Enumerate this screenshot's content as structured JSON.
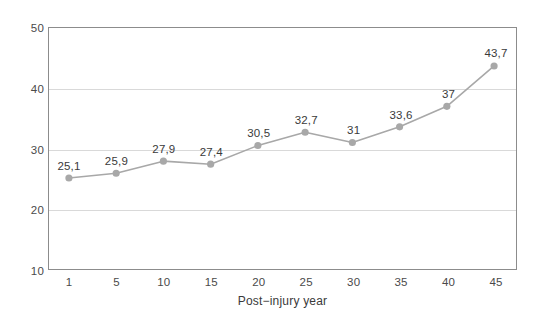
{
  "chart_data": {
    "type": "line",
    "title": "",
    "subtitle": "",
    "xlabel": "Post−injury year",
    "ylabel": "",
    "categories": [
      "1",
      "5",
      "10",
      "15",
      "20",
      "25",
      "30",
      "35",
      "40",
      "45"
    ],
    "values": [
      25.1,
      25.9,
      27.9,
      27.4,
      30.5,
      32.7,
      31,
      33.6,
      37,
      43.7
    ],
    "point_labels": [
      "25,1",
      "25,9",
      "27,9",
      "27,4",
      "30,5",
      "32,7",
      "31",
      "33,6",
      "37",
      "43,7"
    ],
    "series": [
      {
        "name": "",
        "values": [
          25.1,
          25.9,
          27.9,
          27.4,
          30.5,
          32.7,
          31,
          33.6,
          37,
          43.7
        ]
      }
    ],
    "ylim": [
      10,
      50
    ],
    "y_ticks": [
      "10",
      "20",
      "30",
      "40",
      "50"
    ],
    "y_tick_values": [
      10,
      20,
      30,
      40,
      50
    ],
    "x_ticks": [
      "1",
      "5",
      "10",
      "15",
      "20",
      "25",
      "30",
      "35",
      "40",
      "45"
    ],
    "gridlines": {
      "horizontal": [
        20,
        30,
        40
      ],
      "vertical": []
    },
    "legend": {
      "visible": false,
      "position": "none",
      "entries": []
    },
    "colors": {
      "line": "#a8a8a8",
      "marker": "#a8a8a8",
      "grid": "#d9d9d9",
      "frame": "#8c8c8c",
      "text": "#3a3a3a",
      "background": "#ffffff"
    }
  }
}
